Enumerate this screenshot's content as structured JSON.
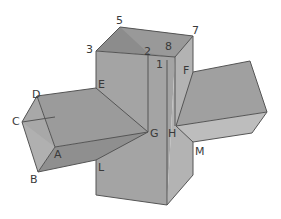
{
  "figure": {
    "labels": {
      "5": "5",
      "3": "3",
      "7": "7",
      "8": "8",
      "2": "2",
      "1": "1",
      "F": "F",
      "E": "E",
      "D": "D",
      "C": "C",
      "A": "A",
      "B": "B",
      "G": "G",
      "H": "H",
      "L": "L",
      "M": "M"
    },
    "colors": {
      "top_inner": "#8e8e8e",
      "front_face": "#a3a3a3",
      "right_face": "#b5b5b5",
      "left_prism_top": "#9a9a9a",
      "left_prism_end": "#b2b2b2",
      "left_prism_bottom": "#8a8a8a",
      "right_prism_top": "#a0a0a0",
      "right_prism_bottom": "#bcbcbc",
      "edge": "#555555"
    }
  }
}
